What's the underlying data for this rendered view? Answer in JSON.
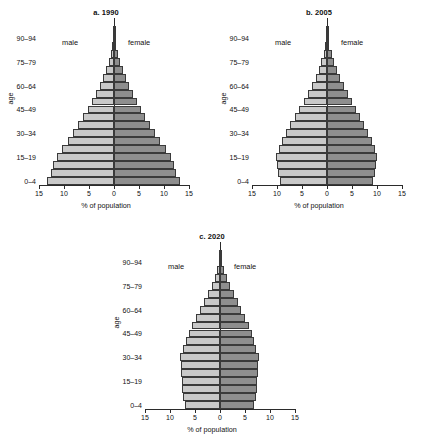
{
  "figure": {
    "axis": {
      "xlabel": "% of population",
      "ylabel": "age",
      "xticks": [
        "15",
        "10",
        "5",
        "0",
        "5",
        "10",
        "15"
      ],
      "xtick_values": [
        -15,
        -10,
        -5,
        0,
        5,
        10,
        15
      ],
      "xlim": [
        -15,
        15
      ],
      "ylabels": [
        "90–94",
        "75–79",
        "60–64",
        "45–49",
        "30–34",
        "15–19",
        "0–4"
      ],
      "legend_male": "male",
      "legend_female": "female",
      "male_color": "#c9c9c9",
      "female_color": "#8e8e8e"
    },
    "panels": [
      {
        "id": "p1990",
        "title": "a. 1990"
      },
      {
        "id": "p2005",
        "title": "b. 2005"
      },
      {
        "id": "p2020",
        "title": "c. 2020"
      }
    ]
  },
  "chart_data": [
    {
      "type": "bar",
      "title": "a. 1990",
      "subtype": "population-pyramid",
      "xlabel": "% of population",
      "ylabel": "age",
      "xlim": [
        -15,
        15
      ],
      "grid": false,
      "categories": [
        "0-4",
        "5-9",
        "10-14",
        "15-19",
        "20-24",
        "25-29",
        "30-34",
        "35-39",
        "40-44",
        "45-49",
        "50-54",
        "55-59",
        "60-64",
        "65-69",
        "70-74",
        "75-79",
        "80-84",
        "85-89",
        "90-94",
        "95-99"
      ],
      "series": [
        {
          "name": "male",
          "side": "left",
          "values": [
            13.4,
            12.6,
            12.2,
            11.5,
            10.4,
            9.3,
            8.2,
            7.2,
            6.2,
            5.3,
            4.4,
            3.6,
            2.9,
            2.2,
            1.6,
            1.1,
            0.65,
            0.32,
            0.12,
            0.03
          ]
        },
        {
          "name": "female",
          "side": "right",
          "values": [
            13.2,
            12.4,
            12.0,
            11.3,
            10.3,
            9.2,
            8.1,
            7.1,
            6.2,
            5.3,
            4.5,
            3.7,
            3.0,
            2.4,
            1.8,
            1.25,
            0.78,
            0.4,
            0.16,
            0.04
          ]
        }
      ]
    },
    {
      "type": "bar",
      "title": "b. 2005",
      "subtype": "population-pyramid",
      "xlabel": "% of population",
      "ylabel": "age",
      "xlim": [
        -15,
        15
      ],
      "grid": false,
      "categories": [
        "0-4",
        "5-9",
        "10-14",
        "15-19",
        "20-24",
        "25-29",
        "30-34",
        "35-39",
        "40-44",
        "45-49",
        "50-54",
        "55-59",
        "60-64",
        "65-69",
        "70-74",
        "75-79",
        "80-84",
        "85-89",
        "90-94",
        "95-99"
      ],
      "series": [
        {
          "name": "male",
          "side": "left",
          "values": [
            9.5,
            9.9,
            10.1,
            10.3,
            9.7,
            9.0,
            8.2,
            7.4,
            6.5,
            5.6,
            4.7,
            3.8,
            3.0,
            2.3,
            1.7,
            1.15,
            0.7,
            0.35,
            0.13,
            0.03
          ]
        },
        {
          "name": "female",
          "side": "right",
          "values": [
            9.2,
            9.6,
            9.8,
            10.0,
            9.5,
            8.9,
            8.2,
            7.4,
            6.6,
            5.8,
            4.9,
            4.1,
            3.3,
            2.6,
            2.0,
            1.4,
            0.9,
            0.45,
            0.18,
            0.05
          ]
        }
      ]
    },
    {
      "type": "bar",
      "title": "c. 2020",
      "subtype": "population-pyramid",
      "xlabel": "% of population",
      "ylabel": "age",
      "xlim": [
        -15,
        15
      ],
      "grid": false,
      "categories": [
        "0-4",
        "5-9",
        "10-14",
        "15-19",
        "20-24",
        "25-29",
        "30-34",
        "35-39",
        "40-44",
        "45-49",
        "50-54",
        "55-59",
        "60-64",
        "65-69",
        "70-74",
        "75-79",
        "80-84",
        "85-89",
        "90-94",
        "95-99"
      ],
      "series": [
        {
          "name": "male",
          "side": "left",
          "values": [
            7.1,
            7.4,
            7.6,
            7.7,
            7.8,
            7.9,
            8.0,
            7.4,
            6.9,
            6.3,
            5.6,
            4.8,
            4.0,
            3.2,
            2.4,
            1.7,
            1.05,
            0.55,
            0.2,
            0.05
          ]
        },
        {
          "name": "female",
          "side": "right",
          "values": [
            6.8,
            7.1,
            7.3,
            7.4,
            7.5,
            7.6,
            7.7,
            7.2,
            6.8,
            6.3,
            5.7,
            5.0,
            4.2,
            3.5,
            2.7,
            2.0,
            1.3,
            0.72,
            0.28,
            0.07
          ]
        }
      ]
    }
  ]
}
